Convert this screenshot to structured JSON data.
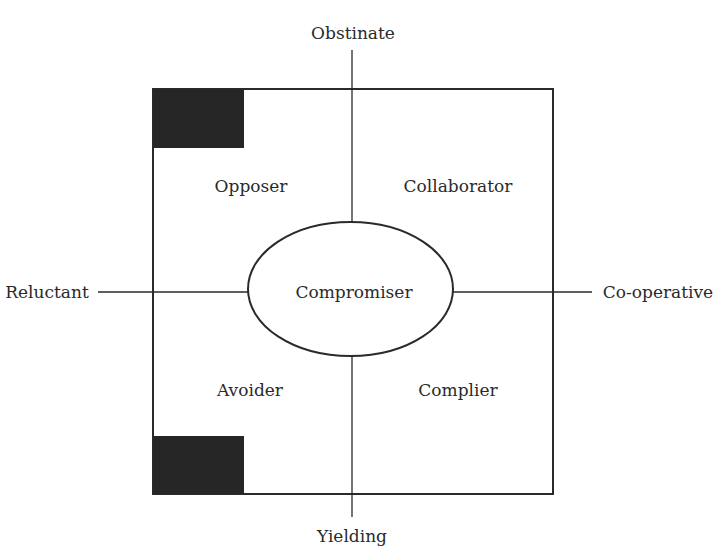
{
  "diagram": {
    "axes": {
      "top": "Obstinate",
      "bottom": "Yielding",
      "left": "Reluctant",
      "right": "Co-operative"
    },
    "quadrants": {
      "top_left": "Opposer",
      "top_right": "Collaborator",
      "bottom_left": "Avoider",
      "bottom_right": "Complier"
    },
    "center": "Compromiser",
    "colors": {
      "line": "#2a2a2a",
      "fill_block": "#262626",
      "background": "#ffffff"
    }
  }
}
